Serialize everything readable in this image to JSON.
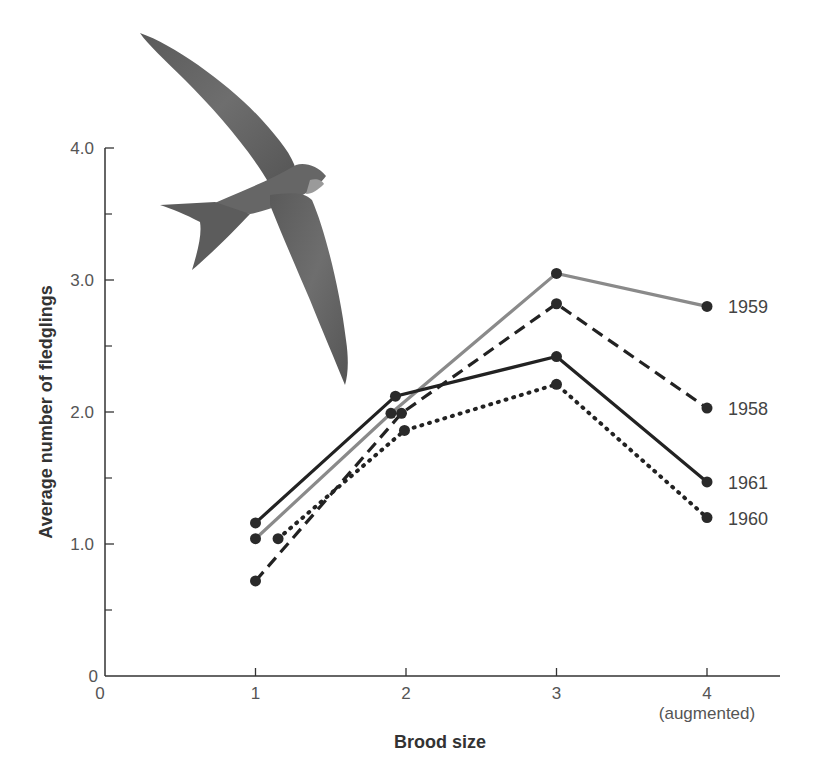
{
  "chart_data": {
    "type": "line",
    "title": "",
    "xlabel": "Brood size",
    "ylabel": "Average number of fledglings",
    "xlim": [
      0,
      4.5
    ],
    "ylim": [
      0,
      4.0
    ],
    "x_ticks": [
      "0",
      "1",
      "2",
      "3",
      "4"
    ],
    "x_tick_sublabel": "(augmented)",
    "y_ticks": [
      "0",
      "1.0",
      "2.0",
      "3.0",
      "4.0"
    ],
    "y_minor_ticks": [
      0.5,
      1.5,
      2.5,
      3.5
    ],
    "grid": false,
    "legend": "inline labels at right end of each line",
    "series": [
      {
        "name": "1959",
        "style": "solid",
        "color": "#8a8a8a",
        "x": [
          1,
          1.9,
          3,
          4
        ],
        "y": [
          1.04,
          1.99,
          3.05,
          2.8
        ]
      },
      {
        "name": "1958",
        "style": "dashed",
        "color": "#222222",
        "x": [
          1,
          1.97,
          3,
          4
        ],
        "y": [
          0.72,
          1.99,
          2.82,
          2.03
        ]
      },
      {
        "name": "1961",
        "style": "solid",
        "color": "#222222",
        "x": [
          1,
          1.93,
          3,
          4
        ],
        "y": [
          1.16,
          2.12,
          2.42,
          1.47
        ]
      },
      {
        "name": "1960",
        "style": "dotted",
        "color": "#222222",
        "x": [
          1.15,
          1.99,
          3,
          4
        ],
        "y": [
          1.04,
          1.86,
          2.21,
          1.2
        ]
      }
    ],
    "illustration": "swift-bird"
  }
}
